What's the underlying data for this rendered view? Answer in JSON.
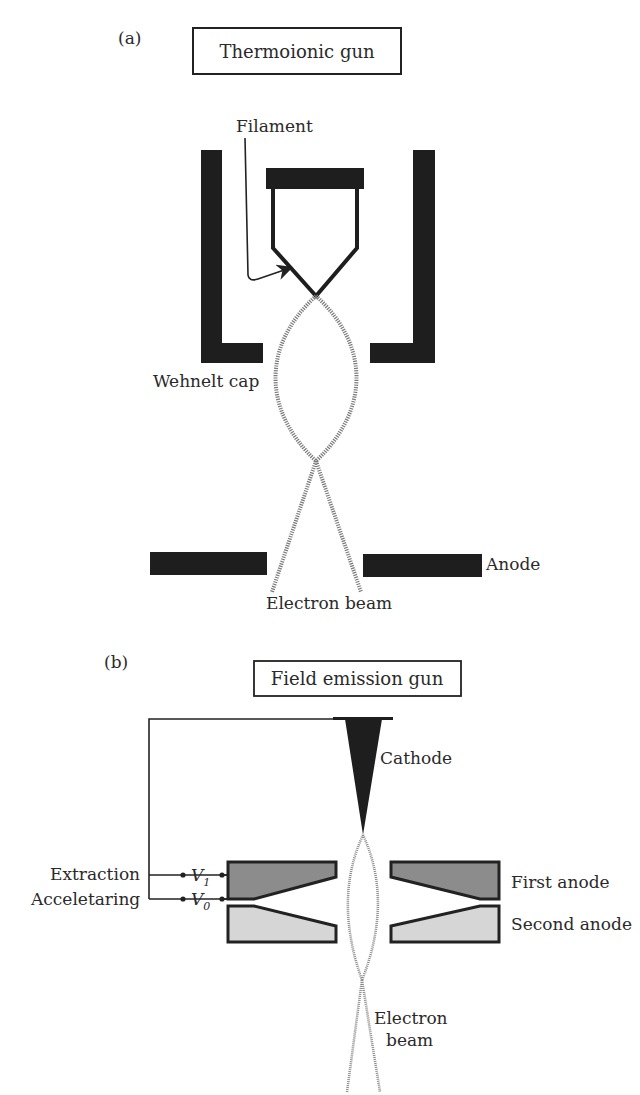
{
  "panel_a": {
    "letter": "(a)",
    "title": "Thermoionic gun",
    "labels": {
      "filament": "Filament",
      "wehnelt": "Wehnelt cap",
      "anode": "Anode",
      "beam": "Electron beam"
    }
  },
  "panel_b": {
    "letter": "(b)",
    "title": "Field emission gun",
    "labels": {
      "cathode": "Cathode",
      "extraction": "Extraction",
      "accelerating": "Acceletaring",
      "v1_main": "V",
      "v1_sub": "1",
      "v0_main": "V",
      "v0_sub": "0",
      "first_anode": "First anode",
      "second_anode": "Second anode",
      "beam_line1": "Electron",
      "beam_line2": "beam"
    }
  },
  "colors": {
    "ink": "#222222",
    "beam": "#8a8a8a",
    "first_anode_fill": "#8c8c8c",
    "second_anode_fill": "#d6d6d6"
  }
}
